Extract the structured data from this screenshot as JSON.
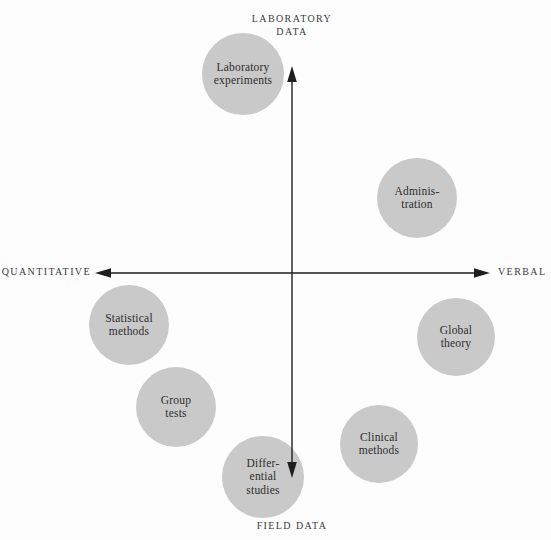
{
  "diagram": {
    "title_implicit": "Methods positioned on quantitative–verbal and laboratory–field axes",
    "colors": {
      "background": "#fdfdfd",
      "circle_fill": "#c9c9c9",
      "circle_text": "#2e2e2e",
      "axis_line": "#1e1e1e",
      "axis_label_text": "#3a3a3a"
    },
    "labels": {
      "top_line1": "LABORATORY",
      "top_line2": "DATA",
      "bottom": "FIELD DATA",
      "left": "QUANTITATIVE",
      "right": "VERBAL"
    },
    "axes": {
      "origin": {
        "x": 292,
        "y": 273
      },
      "horizontal": {
        "tip_left_x": 95,
        "tip_right_x": 490,
        "negative_direction_label": "QUANTITATIVE",
        "positive_direction_label": "VERBAL"
      },
      "vertical": {
        "tip_top_y": 67,
        "tip_bottom_y": 478,
        "positive_direction_label": "LABORATORY DATA",
        "negative_direction_label": "FIELD DATA"
      }
    },
    "nodes": [
      {
        "id": "laboratory-experiments",
        "label": "Laboratory experiments",
        "lines": [
          "Laboratory",
          "experiments"
        ],
        "cx": 243,
        "cy": 74,
        "r": 41
      },
      {
        "id": "administration",
        "label": "Administration",
        "lines": [
          "Adminis-",
          "tration"
        ],
        "cx": 417,
        "cy": 198,
        "r": 40
      },
      {
        "id": "statistical-methods",
        "label": "Statistical methods",
        "lines": [
          "Statistical",
          "methods"
        ],
        "cx": 129,
        "cy": 325,
        "r": 40
      },
      {
        "id": "global-theory",
        "label": "Global theory",
        "lines": [
          "Global",
          "theory"
        ],
        "cx": 456,
        "cy": 337,
        "r": 39
      },
      {
        "id": "group-tests",
        "label": "Group tests",
        "lines": [
          "Group",
          "tests"
        ],
        "cx": 176,
        "cy": 407,
        "r": 40
      },
      {
        "id": "clinical-methods",
        "label": "Clinical methods",
        "lines": [
          "Clinical",
          "methods"
        ],
        "cx": 379,
        "cy": 444,
        "r": 39
      },
      {
        "id": "differential-studies",
        "label": "Differential studies",
        "lines": [
          "Differ-",
          "ential",
          "studies"
        ],
        "cx": 263,
        "cy": 477,
        "r": 41
      }
    ]
  }
}
